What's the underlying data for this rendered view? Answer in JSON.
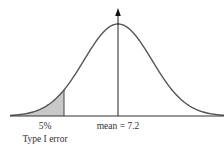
{
  "chart_data": {
    "type": "area",
    "title": "",
    "distribution": "normal",
    "mean_label": "mean = 7.2",
    "mean": 7.2,
    "shaded_region": {
      "tail": "left",
      "percent": "5%",
      "label": "Type I error"
    },
    "xlabel": "",
    "ylabel": "",
    "grid": false,
    "annotations": [
      "5%",
      "Type I error",
      "mean = 7.2"
    ]
  },
  "labels": {
    "percent": "5%",
    "error_type": "Type I error",
    "mean": "mean = 7.2"
  },
  "colors": {
    "curve": "#555555",
    "axis": "#333333",
    "shade": "#c8c8c8"
  },
  "geometry": {
    "baseline_y": 116,
    "x_start": 10,
    "x_end": 224,
    "mean_x": 118,
    "peak_y": 24,
    "sigma_px": 34,
    "cut_x": 64,
    "arrow_top_y": 8
  }
}
